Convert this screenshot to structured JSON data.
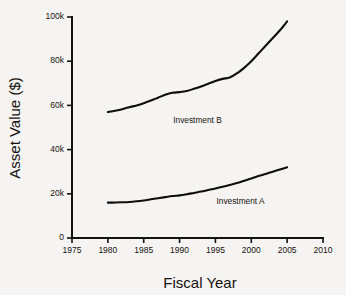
{
  "chart_data": {
    "type": "line",
    "title": "",
    "xlabel": "Fiscal Year",
    "ylabel": "Asset Value ($)",
    "xlim": [
      1975,
      2010
    ],
    "ylim": [
      0,
      100000
    ],
    "grid": false,
    "legend_position": "inline-annotation",
    "x_tick_labels": [
      "1975",
      "1980",
      "1985",
      "1990",
      "1995",
      "2000",
      "2005",
      "2010"
    ],
    "x_tick_values": [
      1975,
      1980,
      1985,
      1990,
      1995,
      2000,
      2005,
      2010
    ],
    "y_tick_labels": [
      "0",
      "20k",
      "40k",
      "60k",
      "80k",
      "100k"
    ],
    "y_tick_values": [
      0,
      20000,
      40000,
      60000,
      80000,
      100000
    ],
    "series": [
      {
        "name": "Investment B",
        "annotation_label": "Investment B",
        "annotation_x": 1992.5,
        "annotation_y": 52000,
        "color": "#100d0b",
        "x": [
          1980,
          1981,
          1982,
          1983,
          1984,
          1985,
          1986,
          1987,
          1988,
          1989,
          1990,
          1991,
          1992,
          1993,
          1994,
          1995,
          1996,
          1997,
          1998,
          1999,
          2000,
          2001,
          2002,
          2003,
          2004,
          2005
        ],
        "values": [
          57000,
          57600,
          58300,
          59200,
          60000,
          61000,
          62200,
          63500,
          64800,
          65700,
          66000,
          66500,
          67500,
          68600,
          69800,
          71000,
          72000,
          72600,
          74500,
          77000,
          80000,
          83500,
          87000,
          90500,
          94000,
          98000
        ]
      },
      {
        "name": "Investment A",
        "annotation_label": "Investment A",
        "annotation_x": 1998.5,
        "annotation_y": 15500,
        "color": "#100d0b",
        "x": [
          1980,
          1981,
          1982,
          1983,
          1984,
          1985,
          1986,
          1987,
          1988,
          1989,
          1990,
          1991,
          1992,
          1993,
          1994,
          1995,
          1996,
          1997,
          1998,
          1999,
          2000,
          2001,
          2002,
          2003,
          2004,
          2005
        ],
        "values": [
          16000,
          16050,
          16150,
          16300,
          16600,
          17000,
          17500,
          18000,
          18500,
          19000,
          19300,
          19800,
          20400,
          21000,
          21700,
          22400,
          23200,
          24000,
          24900,
          25900,
          26900,
          28000,
          29000,
          30000,
          31000,
          32000
        ]
      }
    ]
  }
}
